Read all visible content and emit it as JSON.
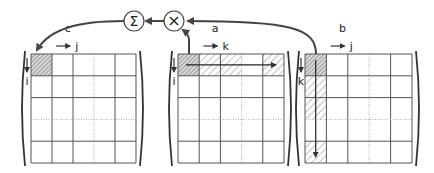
{
  "operators": {
    "sum": {
      "symbol": "Σ",
      "cx": 134,
      "cy": 21
    },
    "multiply": {
      "symbol": "×",
      "cx": 174,
      "cy": 21
    }
  },
  "matrices": [
    {
      "id": "c",
      "name": "c",
      "col_index": "j",
      "row_index": "i",
      "x": 31,
      "y": 54,
      "cols": 5,
      "rows": 5,
      "cell_w": 21,
      "cell_h": 21.8,
      "dotted_cols": [
        3
      ],
      "dotted_rows": [
        3
      ],
      "dark_cells": [
        [
          0,
          0
        ]
      ],
      "hatched_cells": [],
      "arrow": null
    },
    {
      "id": "a",
      "name": "a",
      "col_index": "k",
      "row_index": "i",
      "x": 178,
      "y": 54,
      "cols": 5,
      "rows": 5,
      "cell_w": 21.2,
      "cell_h": 21.8,
      "dotted_cols": [
        3
      ],
      "dotted_rows": [
        3
      ],
      "dark_cells": [
        [
          0,
          0
        ]
      ],
      "hatched_cells": [
        [
          0,
          1
        ],
        [
          0,
          2
        ],
        [
          0,
          4
        ]
      ],
      "arrow": "row"
    },
    {
      "id": "b",
      "name": "b",
      "col_index": "j",
      "row_index": "k",
      "x": 305,
      "y": 54,
      "cols": 5,
      "rows": 5,
      "cell_w": 21.4,
      "cell_h": 21.8,
      "dotted_cols": [
        3
      ],
      "dotted_rows": [
        3
      ],
      "dark_cells": [
        [
          0,
          0
        ]
      ],
      "hatched_cells": [
        [
          1,
          0
        ],
        [
          2,
          0
        ],
        [
          4,
          0
        ]
      ],
      "arrow": "col"
    }
  ],
  "colors": {
    "line": "#555555",
    "dotted": "#aaaaaa",
    "hatch_dark": "#7a7a7a",
    "hatch_light": "#888888",
    "arrow": "#444444"
  }
}
